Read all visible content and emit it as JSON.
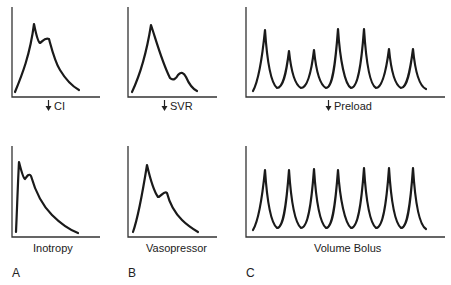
{
  "figure": {
    "panels": [
      {
        "letter": "A",
        "top_label": "CI",
        "top_label_arrow": "down-arrow",
        "bottom_label": "Inotropy"
      },
      {
        "letter": "B",
        "top_label": "SVR",
        "top_label_arrow": "down-arrow",
        "bottom_label": "Vasopressor"
      },
      {
        "letter": "C",
        "top_label": "Preload",
        "top_label_arrow": "down-arrow",
        "bottom_label": "Volume Bolus"
      }
    ],
    "colors": {
      "line": "#1a1a1a",
      "axis": "#333333",
      "background": "#ffffff"
    }
  }
}
